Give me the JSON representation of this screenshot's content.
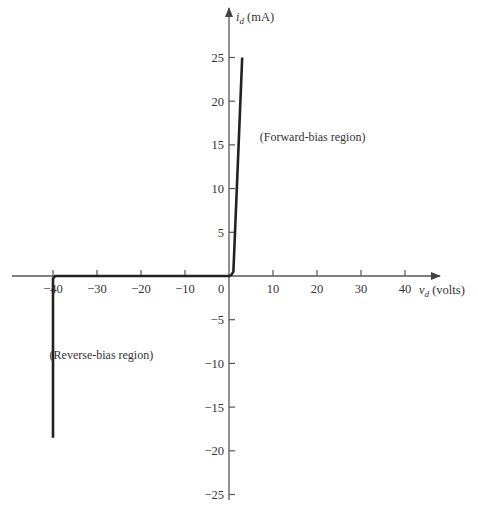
{
  "chart_data": {
    "type": "line",
    "title": "",
    "xlabel": "v_d (volts)",
    "ylabel": "i_d (mA)",
    "xlabel_parts": {
      "symbol": "v",
      "sub": "d",
      "unit": "(volts)"
    },
    "ylabel_parts": {
      "symbol": "i",
      "sub": "d",
      "unit": "(mA)"
    },
    "xlim": [
      -40,
      40
    ],
    "ylim": [
      -25,
      25
    ],
    "grid": false,
    "x_ticks": [
      -40,
      -30,
      -20,
      -10,
      0,
      10,
      20,
      30,
      40
    ],
    "x_tick_labels": [
      "−40",
      "−30",
      "−20",
      "−10",
      "0",
      "10",
      "20",
      "30",
      "40"
    ],
    "y_ticks": [
      25,
      20,
      15,
      10,
      5,
      -5,
      -10,
      -15,
      -20,
      -25
    ],
    "y_tick_labels": [
      "25",
      "20",
      "15",
      "10",
      "5",
      "−5",
      "−10",
      "−15",
      "−20",
      "−25"
    ],
    "series": [
      {
        "name": "diode characteristic",
        "x": [
          -40,
          -40,
          -39.5,
          0,
          0.5,
          1,
          3
        ],
        "y": [
          -18.5,
          -0.3,
          0,
          0,
          0.1,
          0.5,
          25
        ]
      }
    ],
    "annotations": [
      {
        "text": "(Forward-bias region)",
        "x": 19,
        "y": 15.5
      },
      {
        "text": "(Reverse-bias region)",
        "x": -29,
        "y": -9.5
      }
    ],
    "line_color": "#222222",
    "axis_color": "#555555"
  }
}
